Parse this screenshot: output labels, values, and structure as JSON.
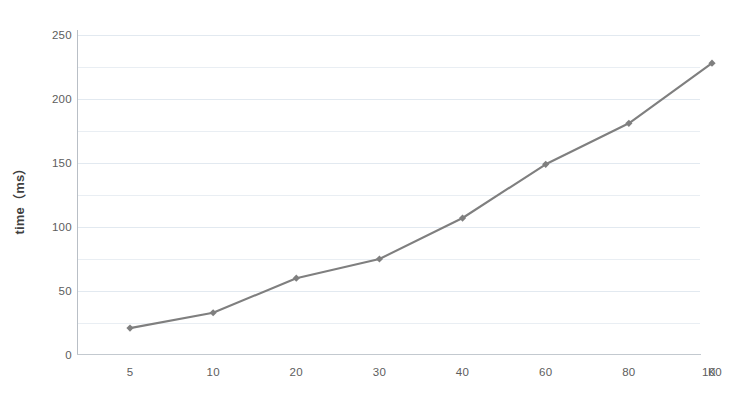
{
  "chart_data": {
    "type": "line",
    "title": "",
    "xlabel": "K",
    "ylabel": "time（ms）",
    "x_tick_labels": [
      "5",
      "10",
      "20",
      "30",
      "40",
      "60",
      "80",
      "100"
    ],
    "categories": [
      5,
      10,
      20,
      30,
      40,
      60,
      80,
      100
    ],
    "values": [
      21,
      33,
      60,
      75,
      107,
      149,
      181,
      228
    ],
    "series": [
      {
        "name": "time",
        "values": [
          21,
          33,
          60,
          75,
          107,
          149,
          181,
          228
        ],
        "color": "#7f7f7f",
        "marker": "diamond"
      }
    ],
    "y_tick_labels": [
      "0",
      "50",
      "100",
      "150",
      "200",
      "250"
    ],
    "y_ticks": [
      0,
      50,
      100,
      150,
      200,
      250
    ],
    "ylim": [
      0,
      250
    ],
    "grid": true,
    "grid_interval": 25,
    "legend": "none",
    "legend_position": "none",
    "x_axis_type": "categorical"
  },
  "axes": {
    "y_title": "time（ms）",
    "x_unit_label": "K"
  },
  "colors": {
    "series_line": "#7f7f7f",
    "grid": "#e9eef3",
    "axis": "#b9bfc6",
    "tick_text": "#5d5d5d",
    "background": "#ffffff"
  }
}
